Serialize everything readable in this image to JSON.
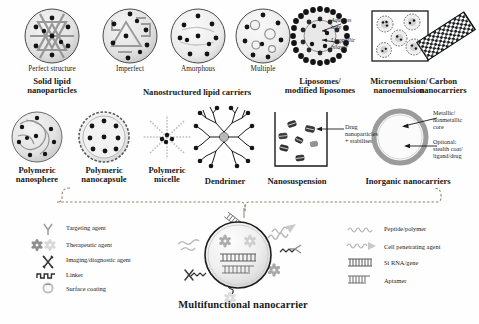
{
  "figure": {
    "title": "Multifunctional nanocarrier",
    "background": "#fefefe",
    "ink": "#1a1a1a"
  },
  "row1": {
    "sub_labels": [
      {
        "text": "Perfect structure",
        "x": 52,
        "y": 72
      },
      {
        "text": "Imperfect",
        "x": 130,
        "y": 72
      },
      {
        "text": "Amorphous",
        "x": 198,
        "y": 72
      },
      {
        "text": "Multiple",
        "x": 263,
        "y": 72
      }
    ],
    "group_labels": [
      {
        "line1": "Solid lipid",
        "line2": "nanoparticles",
        "x": 52,
        "y": 82
      },
      {
        "line1": "Nanostructured lipid carriers",
        "line2": "",
        "x": 196,
        "y": 88
      },
      {
        "line1": "Liposomes/",
        "line2": "modified liposomes",
        "x": 320,
        "y": 82
      },
      {
        "line1": "Microemulsion/",
        "line2": "nanoemulsion",
        "x": 399,
        "y": 82
      },
      {
        "line1": "Carbon",
        "line2": "nanocarriers",
        "x": 446,
        "y": 82
      }
    ],
    "annotations": [
      {
        "line1": "Aqueous",
        "line2": "core",
        "x": 343,
        "y": 22
      },
      {
        "line1": "Lipophilic",
        "line2": "bilayer",
        "x": 343,
        "y": 41
      }
    ]
  },
  "row2": {
    "group_labels": [
      {
        "line1": "Polymeric",
        "line2": "nanosphere",
        "x": 37,
        "y": 172
      },
      {
        "line1": "Polymeric",
        "line2": "nanocapsule",
        "x": 104,
        "y": 172
      },
      {
        "line1": "Polymeric",
        "line2": "micelle",
        "x": 167,
        "y": 172
      },
      {
        "line1": "Dendrimer",
        "line2": "",
        "x": 224,
        "y": 178
      },
      {
        "line1": "Nanosuspension",
        "line2": "",
        "x": 297,
        "y": 178
      },
      {
        "line1": "Inorganic nanocarriers",
        "line2": "",
        "x": 408,
        "y": 178
      }
    ],
    "annotations": [
      {
        "line1": "Drug",
        "line2": "nanoparticles",
        "line3": "+ stabiliser",
        "x": 314,
        "y": 128
      },
      {
        "line1": "Metallic/",
        "line2": "nonmetallic",
        "line3": "core",
        "x": 443,
        "y": 117
      },
      {
        "line1": "Optional:",
        "line2": "stealth coat/",
        "line3": "ligand/drug",
        "x": 443,
        "y": 145
      }
    ]
  },
  "legend_left": {
    "items": [
      {
        "icon": "targeting-agent-icon",
        "label": "Targeting agent"
      },
      {
        "icon": "therapeutic-agent-icon",
        "label": "Therapeutic agent"
      },
      {
        "icon": "imaging-diagnostic-agent-icon",
        "label": "Imaging/diagnostic agent"
      },
      {
        "icon": "linker-icon",
        "label": "Linker"
      },
      {
        "icon": "surface-coating-icon",
        "label": "Surface coating"
      }
    ]
  },
  "legend_right": {
    "items": [
      {
        "icon": "peptide-polymer-icon",
        "label": "Peptide/polymer"
      },
      {
        "icon": "cell-penetrating-agent-icon",
        "label": "Cell penetrating agent"
      },
      {
        "icon": "si-rna-gene-icon",
        "label": "Si RNA/gene"
      },
      {
        "icon": "aptamer-icon",
        "label": "Aptamer"
      }
    ]
  }
}
